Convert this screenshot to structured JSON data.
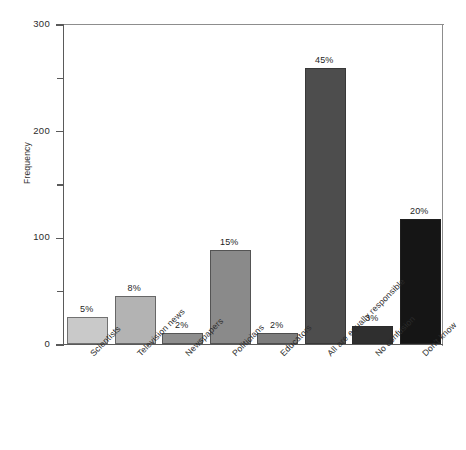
{
  "chart_data": {
    "type": "bar",
    "title": "",
    "xlabel": "",
    "ylabel": "Frequency",
    "ylim": [
      0,
      300
    ],
    "yticks": [
      0,
      100,
      200,
      300
    ],
    "ytick_labels": [
      "0",
      "100",
      "200",
      "300"
    ],
    "yminor_ticks": [
      50,
      150,
      250
    ],
    "grid": false,
    "legend": "none",
    "categories": [
      "Scientists",
      "Television news",
      "Newspapers",
      "Politicians",
      "Educators",
      "All are equally responsible",
      "No confusion",
      "Don't know"
    ],
    "values": [
      25,
      45,
      10,
      88,
      10,
      259,
      17,
      117
    ],
    "data_labels": [
      "5%",
      "8%",
      "2%",
      "15%",
      "2%",
      "45%",
      "3%",
      "20%"
    ],
    "bar_colors": [
      "#c9c9c9",
      "#b3b3b3",
      "#8e8e8e",
      "#8a8a8a",
      "#7d7d7d",
      "#4d4d4d",
      "#2f2f2f",
      "#151515"
    ]
  },
  "axis": {
    "ylabel": "Frequency",
    "frame_color": "#5a5a5a"
  }
}
